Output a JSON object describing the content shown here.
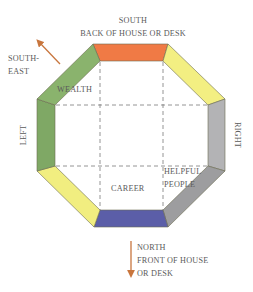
{
  "diagram": {
    "title_top": "SOUTH",
    "subtitle_top": "BACK OF HOUSE OR DESK",
    "southeast_line1": "SOUTH-",
    "southeast_line2": "EAST",
    "left_label": "LEFT",
    "right_label": "RIGHT",
    "bottom_line1": "NORTH",
    "bottom_line2": "FRONT OF HOUSE",
    "bottom_line3": "OR DESK",
    "areas": {
      "wealth": "WEALTH",
      "career": "CAREER",
      "helpful_line1": "HELPFUL",
      "helpful_line2": "PEOPLE"
    },
    "colors": {
      "top": "#f07a45",
      "top_right": "#f3ef82",
      "right": "#a9a9ab",
      "bottom_right": "#9b9b9d",
      "bottom": "#5b5ea8",
      "bottom_left": "#f1ee80",
      "left": "#86ad6a",
      "top_left": "#8ab36d",
      "arrow": "#c8763e"
    }
  }
}
